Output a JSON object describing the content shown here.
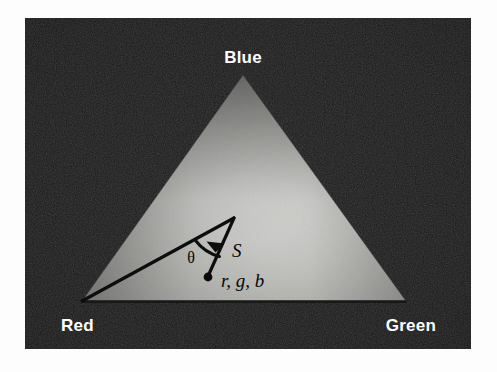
{
  "figure": {
    "canvas": {
      "width": 497,
      "height": 372,
      "background": "#fdfdfd"
    },
    "panel": {
      "name": "dark-photo-panel",
      "x": 25,
      "y": 18,
      "width": 446,
      "height": 331,
      "fill": "#0a0a0a"
    },
    "triangle": {
      "name": "rgb-gradient-triangle",
      "apex": {
        "x": 243,
        "y": 75
      },
      "left": {
        "x": 82,
        "y": 301
      },
      "right": {
        "x": 406,
        "y": 301
      },
      "highlight": {
        "x": 258,
        "y": 208,
        "color": "#f2f2f0"
      },
      "edge_color": "#3a3a3a"
    },
    "vertex_labels": [
      {
        "key": "blue",
        "text": "Blue",
        "x": 243,
        "y": 63,
        "anchor": "middle",
        "color": "#ffffff"
      },
      {
        "key": "red",
        "text": "Red",
        "x": 61,
        "y": 331,
        "anchor": "start",
        "color": "#ffffff"
      },
      {
        "key": "green",
        "text": "Green",
        "x": 436,
        "y": 331,
        "anchor": "end",
        "color": "#ffffff"
      }
    ],
    "annotations": {
      "point": {
        "name": "rgb-sample-point",
        "x": 208,
        "y": 277,
        "radius": 4.2,
        "color": "#0a0a0a"
      },
      "hue_axis": {
        "name": "hue-reference-line",
        "from": {
          "x": 82,
          "y": 301
        },
        "to": {
          "x": 234,
          "y": 218
        },
        "color": "#0f0f0f",
        "width": 3.2
      },
      "saturation_vector": {
        "name": "saturation-vector",
        "from": {
          "x": 234,
          "y": 218
        },
        "to": {
          "x": 210,
          "y": 272
        },
        "arrow_at": {
          "x": 215,
          "y": 250
        },
        "color": "#0f0f0f",
        "width": 3.2
      },
      "angle_arc": {
        "name": "hue-angle-arc",
        "center": {
          "x": 234,
          "y": 218
        },
        "radius": 44,
        "color": "#0f0f0f",
        "width": 3.0
      },
      "labels": [
        {
          "key": "theta",
          "text": "θ",
          "x": 191,
          "y": 263,
          "style": "theta"
        },
        {
          "key": "s",
          "text": "S",
          "x": 232,
          "y": 257,
          "style": "math"
        },
        {
          "key": "rgb",
          "text": "r, g, b",
          "x": 221,
          "y": 287,
          "style": "math"
        }
      ]
    }
  }
}
